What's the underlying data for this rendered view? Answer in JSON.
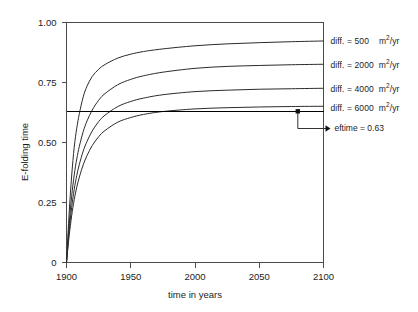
{
  "chart_data": {
    "type": "line",
    "title": "",
    "xlabel": "time in years",
    "ylabel": "E-folding time",
    "xlim": [
      1900,
      2100
    ],
    "ylim": [
      0,
      1.0
    ],
    "xticks": [
      1900,
      1950,
      2000,
      2050,
      2100
    ],
    "xtick_labels": [
      "1900",
      "1950",
      "2000",
      "2050",
      "2100"
    ],
    "yticks": [
      0,
      0.25,
      0.5,
      0.75,
      1.0
    ],
    "ytick_labels": [
      "0",
      "0.25",
      "0.50",
      "0.75",
      "1.00"
    ],
    "grid": false,
    "legend_position": "right-outside",
    "series": [
      {
        "name": "diff. = 500 m2/yr",
        "label_prefix": "diff. =",
        "value": "500",
        "units_base": "m",
        "units_exp": "2",
        "units_suffix": "/yr",
        "asymptote": 0.92,
        "x": [
          1900,
          1902,
          1904,
          1906,
          1908,
          1910,
          1913,
          1916,
          1920,
          1925,
          1930,
          1940,
          1950,
          1960,
          1975,
          2000,
          2025,
          2050,
          2075,
          2100
        ],
        "y": [
          0.0,
          0.2,
          0.36,
          0.48,
          0.56,
          0.62,
          0.69,
          0.735,
          0.775,
          0.805,
          0.825,
          0.852,
          0.868,
          0.879,
          0.89,
          0.903,
          0.911,
          0.916,
          0.92,
          0.923
        ]
      },
      {
        "name": "diff. = 2000 m2/yr",
        "label_prefix": "diff. =",
        "value": "2000",
        "units_base": "m",
        "units_exp": "2",
        "units_suffix": "/yr",
        "asymptote": 0.82,
        "x": [
          1900,
          1902,
          1904,
          1906,
          1908,
          1910,
          1913,
          1916,
          1920,
          1925,
          1930,
          1940,
          1950,
          1960,
          1975,
          2000,
          2025,
          2050,
          2075,
          2100
        ],
        "y": [
          0.0,
          0.155,
          0.275,
          0.365,
          0.432,
          0.484,
          0.545,
          0.59,
          0.635,
          0.676,
          0.704,
          0.741,
          0.763,
          0.778,
          0.793,
          0.809,
          0.817,
          0.821,
          0.824,
          0.826
        ]
      },
      {
        "name": "diff. = 4000 m2/yr",
        "label_prefix": "diff. =",
        "value": "4000",
        "units_base": "m",
        "units_exp": "2",
        "units_suffix": "/yr",
        "asymptote": 0.72,
        "x": [
          1900,
          1902,
          1904,
          1906,
          1908,
          1910,
          1913,
          1916,
          1920,
          1925,
          1930,
          1940,
          1950,
          1960,
          1975,
          2000,
          2025,
          2050,
          2075,
          2100
        ],
        "y": [
          0.0,
          0.128,
          0.228,
          0.305,
          0.363,
          0.409,
          0.464,
          0.505,
          0.548,
          0.587,
          0.614,
          0.65,
          0.671,
          0.685,
          0.699,
          0.712,
          0.718,
          0.722,
          0.724,
          0.726
        ]
      },
      {
        "name": "diff. = 6000 m2/yr",
        "label_prefix": "diff. =",
        "value": "6000",
        "units_base": "m",
        "units_exp": "2",
        "units_suffix": "/yr",
        "asymptote": 0.64,
        "x": [
          1900,
          1902,
          1904,
          1906,
          1908,
          1910,
          1913,
          1916,
          1920,
          1925,
          1930,
          1940,
          1950,
          1960,
          1975,
          2000,
          2025,
          2050,
          2075,
          2100
        ],
        "y": [
          0.0,
          0.108,
          0.194,
          0.262,
          0.314,
          0.356,
          0.407,
          0.446,
          0.487,
          0.524,
          0.55,
          0.585,
          0.604,
          0.617,
          0.629,
          0.64,
          0.645,
          0.648,
          0.65,
          0.651
        ]
      }
    ],
    "annotations": [
      {
        "name": "eftime-line",
        "type": "hline",
        "value": 0.63,
        "label": "eftime = 0.63",
        "marker_x": 2080
      }
    ]
  },
  "legend": {
    "items": [
      {
        "text": "diff. = 500",
        "units": "m2/yr"
      },
      {
        "text": "diff. = 2000",
        "units": "m2/yr"
      },
      {
        "text": "diff. = 4000",
        "units": "m2/yr"
      },
      {
        "text": "diff. = 6000",
        "units": "m2/yr"
      }
    ]
  },
  "annotation": {
    "eftime_label": "eftime = 0.63"
  }
}
